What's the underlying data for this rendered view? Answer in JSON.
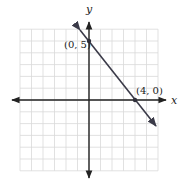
{
  "chart_data": {
    "type": "line",
    "title": "",
    "xlabel": "x",
    "ylabel": "y",
    "xlim": [
      -6,
      6
    ],
    "ylim": [
      -6,
      6
    ],
    "grid": true,
    "grid_step": 1,
    "series": [
      {
        "name": "line",
        "equation": "y = -5/4 x + 5",
        "x": [
          0,
          4
        ],
        "y": [
          5,
          0
        ],
        "extends_beyond_points": true
      }
    ],
    "annotations": [
      {
        "label": "(0, 5)",
        "x": 0,
        "y": 5
      },
      {
        "label": "(4, 0)",
        "x": 4,
        "y": 0
      }
    ]
  },
  "labels": {
    "x_axis": "x",
    "y_axis": "y",
    "point_a": "(0, 5)",
    "point_b": "(4, 0)"
  },
  "colors": {
    "grid": "#d9d9d9",
    "axis": "#222222",
    "line": "#3a3a48",
    "point": "#2f2f3a"
  }
}
